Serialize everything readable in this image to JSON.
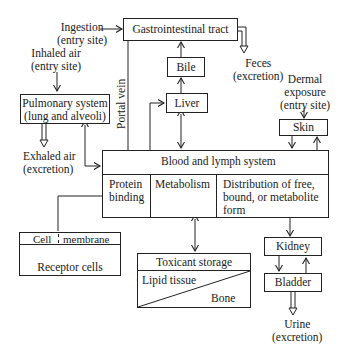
{
  "diagram": {
    "nodes": {
      "gi_tract": "Gastrointestinal tract",
      "bile": "Bile",
      "liver": "Liver",
      "pulmonary_line1": "Pulmonary system",
      "pulmonary_line2": "(lung and alveoli)",
      "skin": "Skin",
      "blood_lymph": "Blood and lymph system",
      "protein_binding_line1": "Protein",
      "protein_binding_line2": "binding",
      "metabolism": "Metabolism",
      "distribution_line1": "Distribution of free,",
      "distribution_line2": "bound, or metabolite",
      "distribution_line3": "form",
      "cell_membrane_left": "Cell",
      "cell_membrane_right": "membrane",
      "receptor_cells": "Receptor cells",
      "toxicant_storage": "Toxicant storage",
      "lipid_tissue": "Lipid tissue",
      "bone": "Bone",
      "kidney": "Kidney",
      "bladder": "Bladder"
    },
    "labels": {
      "ingestion_line1": "Ingestion",
      "ingestion_line2": "(entry site)",
      "inhaled_line1": "Inhaled air",
      "inhaled_line2": "(entry site)",
      "feces_line1": "Feces",
      "feces_line2": "(excretion)",
      "dermal_line1": "Dermal",
      "dermal_line2": "exposure",
      "dermal_line3": "(entry site)",
      "exhaled_line1": "Exhaled air",
      "exhaled_line2": "(excretion)",
      "urine_line1": "Urine",
      "urine_line2": "(excretion)",
      "portal_vein": "Portal vein"
    }
  }
}
